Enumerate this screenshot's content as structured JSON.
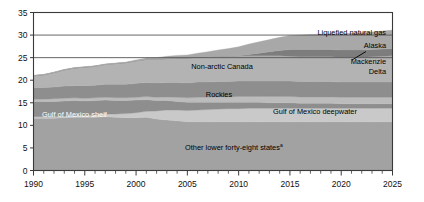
{
  "chart_data": {
    "type": "area",
    "title": "",
    "subtitle": "",
    "xlabel": "",
    "ylabel": "",
    "xlim": [
      1990,
      2025
    ],
    "ylim": [
      0,
      35
    ],
    "yticks": [
      0,
      5,
      10,
      15,
      20,
      25,
      30,
      35
    ],
    "ytick_labels": [
      "0",
      "5",
      "10",
      "15",
      "20",
      "25",
      "30",
      "35"
    ],
    "xticks": [
      1990,
      1995,
      2000,
      2005,
      2010,
      2015,
      2020,
      2025
    ],
    "xtick_labels": [
      "1990",
      "1995",
      "2000",
      "2005",
      "2010",
      "2015",
      "2020",
      "2025"
    ],
    "minor_xtick_interval": 1,
    "gridlines": [
      25,
      30,
      35
    ],
    "grid": true,
    "legend": "inline-band-labels",
    "stacked": true,
    "x": [
      1990,
      1991,
      1992,
      1993,
      1994,
      1995,
      1996,
      1997,
      1998,
      1999,
      2000,
      2001,
      2002,
      2003,
      2004,
      2005,
      2006,
      2007,
      2008,
      2009,
      2010,
      2011,
      2012,
      2013,
      2014,
      2015,
      2016,
      2017,
      2018,
      2019,
      2020,
      2021,
      2022,
      2023,
      2024,
      2025
    ],
    "series": [
      {
        "name": "Other lower forty-eight states",
        "label": "Other lower forty-eight states",
        "label_superscript": "a",
        "color": "#a2a2a2",
        "values": [
          11.6,
          11.6,
          11.6,
          11.7,
          11.8,
          11.8,
          11.8,
          11.9,
          11.8,
          11.7,
          11.7,
          11.8,
          11.4,
          11.2,
          11.0,
          10.8,
          10.8,
          10.8,
          10.8,
          10.8,
          10.8,
          10.8,
          10.8,
          10.8,
          10.8,
          10.8,
          10.8,
          10.8,
          10.8,
          10.8,
          10.8,
          10.8,
          10.8,
          10.8,
          10.8,
          10.8
        ]
      },
      {
        "name": "Gulf of Mexico deepwater",
        "label": "Gulf of Mexico deepwater",
        "color": "#c9c9c9",
        "values": [
          0.3,
          0.3,
          0.3,
          0.3,
          0.4,
          0.4,
          0.5,
          0.6,
          0.7,
          0.9,
          1.1,
          1.3,
          1.8,
          2.2,
          2.4,
          2.5,
          2.6,
          2.7,
          2.8,
          2.9,
          2.9,
          3.0,
          3.0,
          3.0,
          3.0,
          3.0,
          3.0,
          3.0,
          3.0,
          3.0,
          3.0,
          3.0,
          3.0,
          3.0,
          3.0,
          3.0
        ]
      },
      {
        "name": "Gulf of Mexico shelf",
        "label": "Gulf of Mexico shelf",
        "color": "#8e8e8e",
        "values": [
          3.4,
          3.4,
          3.4,
          3.4,
          3.3,
          3.2,
          3.2,
          3.1,
          3.0,
          2.9,
          2.8,
          2.6,
          2.3,
          2.1,
          1.9,
          1.8,
          1.7,
          1.6,
          1.5,
          1.4,
          1.4,
          1.3,
          1.3,
          1.2,
          1.2,
          1.2,
          1.1,
          1.1,
          1.1,
          1.1,
          1.0,
          1.0,
          1.0,
          1.0,
          1.0,
          1.0
        ]
      },
      {
        "name": "Rockies",
        "label": "Rockies",
        "color": "#bcbcbc",
        "values": [
          0.5,
          0.5,
          0.6,
          0.6,
          0.6,
          0.6,
          0.6,
          0.6,
          0.6,
          0.6,
          0.6,
          0.7,
          0.7,
          0.8,
          0.9,
          1.0,
          1.1,
          1.1,
          1.2,
          1.2,
          1.3,
          1.3,
          1.3,
          1.4,
          1.4,
          1.4,
          1.4,
          1.4,
          1.4,
          1.4,
          1.4,
          1.4,
          1.4,
          1.4,
          1.4,
          1.4
        ]
      },
      {
        "name": "Rockies-upper",
        "label": "",
        "color": "#8e8e8e",
        "values": [
          2.6,
          2.6,
          2.6,
          2.7,
          2.7,
          2.8,
          2.8,
          2.9,
          3.0,
          3.0,
          3.1,
          3.1,
          3.2,
          3.2,
          3.3,
          3.3,
          3.4,
          3.4,
          3.4,
          3.4,
          3.4,
          3.4,
          3.4,
          3.4,
          3.4,
          3.4,
          3.4,
          3.4,
          3.4,
          3.4,
          3.4,
          3.4,
          3.4,
          3.4,
          3.4,
          3.4
        ]
      },
      {
        "name": "Non-arctic Canada",
        "label": "Non-arctic Canada",
        "color": "#b3b3b3",
        "values": [
          2.6,
          2.8,
          3.2,
          3.6,
          3.9,
          4.1,
          4.2,
          4.4,
          4.6,
          4.8,
          5.0,
          5.1,
          5.2,
          5.3,
          5.4,
          5.5,
          5.5,
          5.6,
          5.6,
          5.6,
          5.6,
          5.6,
          5.6,
          5.6,
          5.6,
          5.5,
          5.5,
          5.5,
          5.5,
          5.5,
          5.5,
          5.5,
          5.5,
          5.6,
          5.7,
          5.8
        ]
      },
      {
        "name": "Alaska / Mackenzie Delta",
        "label": "Alaska",
        "label2": "Mackenzie",
        "label3": "Delta",
        "color": "#7d7d7d",
        "values": [
          0.0,
          0.0,
          0.0,
          0.0,
          0.0,
          0.0,
          0.0,
          0.0,
          0.0,
          0.0,
          0.0,
          0.0,
          0.0,
          0.0,
          0.0,
          0.0,
          0.0,
          0.0,
          0.0,
          0.0,
          0.0,
          0.3,
          0.6,
          0.9,
          1.2,
          1.5,
          1.6,
          1.6,
          1.6,
          1.6,
          1.6,
          1.6,
          1.6,
          1.6,
          1.6,
          1.6
        ]
      },
      {
        "name": "Liquefied natural gas",
        "label": "Liquefied natural gas",
        "color": "#a8a8a8",
        "values": [
          0.1,
          0.1,
          0.1,
          0.1,
          0.1,
          0.1,
          0.1,
          0.1,
          0.1,
          0.1,
          0.2,
          0.3,
          0.4,
          0.5,
          0.6,
          0.7,
          0.9,
          1.1,
          1.4,
          1.7,
          2.0,
          2.3,
          2.5,
          2.7,
          2.9,
          3.1,
          3.2,
          3.3,
          3.4,
          3.5,
          3.6,
          3.7,
          3.8,
          3.9,
          4.0,
          4.1
        ]
      }
    ],
    "totals_note": "Stacked total rises from about 21 in 1990 to about 30 in 2025",
    "annotations": [
      {
        "text": "Mackenzie Delta leader line",
        "type": "leader-line"
      }
    ]
  },
  "colors": {
    "plot_border": "#3a3a3a",
    "gridline": "#555555",
    "axis_text": "#111111",
    "background": "#ffffff"
  }
}
